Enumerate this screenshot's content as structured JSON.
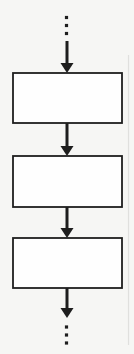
{
  "canvas": {
    "width": 134,
    "height": 354,
    "background": "#f6f6f4"
  },
  "diagram": {
    "type": "flowchart",
    "line_color": "#1e1e1e",
    "box_fill": "#fefefe",
    "box_stroke_width": 1.8,
    "shaft_width": 3,
    "head_width": 13,
    "head_length": 10,
    "dot_size": 3.2,
    "boxes": [
      {
        "name": "process-box-1",
        "x": 13,
        "y": 73,
        "width": 109,
        "height": 50,
        "label": ""
      },
      {
        "name": "process-box-2",
        "x": 13,
        "y": 156,
        "width": 109,
        "height": 51,
        "label": ""
      },
      {
        "name": "process-box-3",
        "x": 13,
        "y": 238,
        "width": 109,
        "height": 50,
        "label": ""
      }
    ],
    "arrows": [
      {
        "name": "arrow-into-box-1",
        "x": 67,
        "y_start": 41,
        "y_tip": 73
      },
      {
        "name": "arrow-box-1-to-box-2",
        "x": 67,
        "y_start": 123,
        "y_tip": 156
      },
      {
        "name": "arrow-box-2-to-box-3",
        "x": 67,
        "y_start": 207,
        "y_tip": 238
      },
      {
        "name": "arrow-out-of-box-3",
        "x": 67,
        "y_start": 288,
        "y_tip": 318
      }
    ],
    "ellipses": [
      {
        "name": "ellipsis-top",
        "x_center": 66.5,
        "dot_y_centers": [
          17.5,
          25.5,
          33.5
        ]
      },
      {
        "name": "ellipsis-bottom",
        "x_center": 66.5,
        "dot_y_centers": [
          327,
          335,
          343
        ]
      }
    ],
    "page_edge_line": {
      "x": 128.5,
      "y1": 55,
      "y2": 345,
      "color": "#e0e0de",
      "width": 1.2
    }
  }
}
